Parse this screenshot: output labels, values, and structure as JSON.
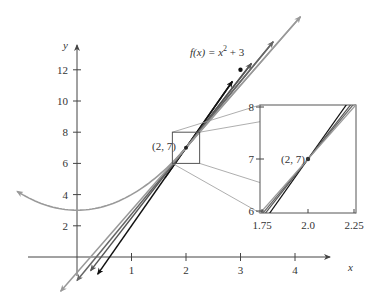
{
  "chart_data": {
    "type": "line",
    "title": "",
    "function_label": "f(x) = x² + 3",
    "function_label_parts": {
      "prefix": "f(x) = x",
      "exp": "2",
      "suffix": " + 3"
    },
    "xlabel": "x",
    "ylabel": "y",
    "xlim": [
      -1,
      4.6
    ],
    "ylim": [
      -3,
      14
    ],
    "x_ticks": [
      1,
      2,
      3,
      4
    ],
    "x_tick_labels": [
      "1",
      "2",
      "3",
      "4"
    ],
    "y_ticks": [
      2,
      4,
      6,
      8,
      10,
      12
    ],
    "y_tick_labels": [
      "2",
      "4",
      "6",
      "8",
      "10",
      "12"
    ],
    "grid": false,
    "curve": {
      "name": "f(x) = x^2 + 3",
      "x_range": [
        -1.1,
        2.2
      ],
      "color": "#9a9a9a"
    },
    "point": {
      "x": 2,
      "y": 7,
      "label": "(2, 7)"
    },
    "series": [
      {
        "name": "secant through (3, 12)",
        "slope": 5,
        "through": [
          2,
          7
        ],
        "marked_point": [
          3,
          12
        ],
        "x_range": [
          0.38,
          2.85
        ],
        "color": "#111111"
      },
      {
        "name": "secant through (2.5, 9.25)",
        "slope": 4.5,
        "through": [
          2,
          7
        ],
        "x_range": [
          0.25,
          3.2
        ],
        "color": "#555555"
      },
      {
        "name": "secant through (2.25, 8.0625)",
        "slope": 4.25,
        "through": [
          2,
          7
        ],
        "x_range": [
          0.0,
          3.6
        ],
        "color": "#666666"
      },
      {
        "name": "tangent line at (2, 7)",
        "slope": 4,
        "through": [
          2,
          7
        ],
        "x_range": [
          -0.3,
          4.1
        ],
        "color": "#999999"
      }
    ],
    "inset": {
      "xlim": [
        1.75,
        2.25
      ],
      "ylim": [
        6,
        8
      ],
      "x_ticks": [
        1.75,
        2.0,
        2.25
      ],
      "x_tick_labels": [
        "1.75",
        "2.0",
        "2.25"
      ],
      "y_ticks": [
        6,
        7,
        8
      ],
      "y_tick_labels": [
        "6",
        "7",
        "8"
      ],
      "point_label": "(2, 7)"
    }
  }
}
